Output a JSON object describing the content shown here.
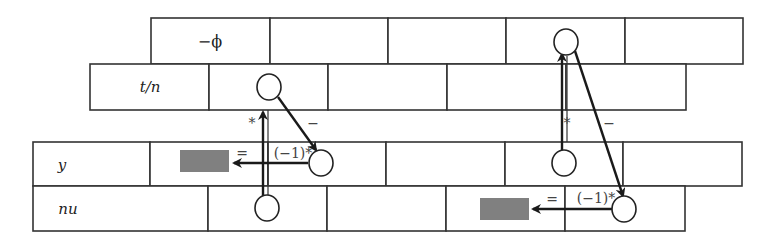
{
  "diagram": {
    "rows": [
      {
        "id": "phi",
        "label": "−ϕ",
        "y": 18,
        "h": 46,
        "dividers": [
          151,
          270,
          388,
          506,
          625,
          743
        ]
      },
      {
        "id": "tn",
        "label": "t/n",
        "y": 64,
        "h": 46,
        "dividers": [
          90,
          209,
          328,
          447,
          566,
          686
        ]
      },
      {
        "id": "y",
        "label": "y",
        "y": 142,
        "h": 44,
        "dividers": [
          33,
          150,
          268,
          386,
          505,
          623,
          742
        ]
      },
      {
        "id": "nu",
        "label": "nu",
        "y": 186,
        "h": 45,
        "dividers": [
          33,
          208,
          327,
          446,
          565,
          685
        ]
      }
    ],
    "operations": [
      {
        "id": "left",
        "star_label": "*",
        "minus_label": "−",
        "equals_label": "=",
        "factor_label": "(−1)*"
      },
      {
        "id": "right",
        "star_label": "*",
        "minus_label": "−",
        "equals_label": "=",
        "factor_label": "(−1)*"
      }
    ],
    "colors": {
      "line": "#333333",
      "arrow": "#1a1a1a",
      "result_fill": "#808080",
      "background": "#ffffff"
    }
  }
}
